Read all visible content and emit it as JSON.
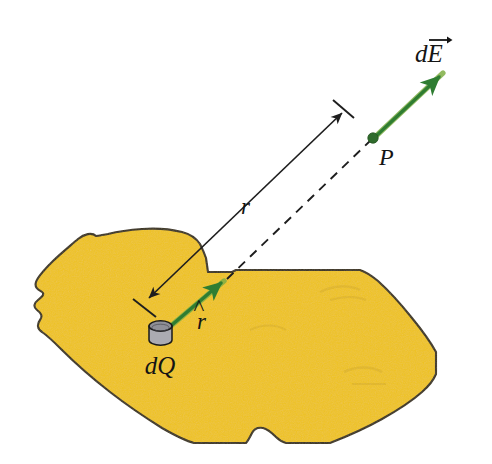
{
  "figure": {
    "type": "physics-vector-diagram"
  },
  "labels": {
    "field_vector": "dE",
    "field_vector_arrow": "→",
    "point": "P",
    "distance": "r",
    "unit_vector": "r",
    "unit_vector_hat": "^",
    "charge_element": "dQ"
  },
  "colors": {
    "surface_fill": "#EFC31C",
    "surface_fill_shade": "#E8BC16",
    "surface_outline": "#3A3119",
    "vector_green": "#2F7D32",
    "vector_green_light": "#6FA83F",
    "point_green": "#2F6B2C",
    "cylinder_top": "#8F8F97",
    "cylinder_body": "#ABABB2",
    "cylinder_outline": "#1A1A1A",
    "line_black": "#1E1E1E",
    "background": "#FFFFFF"
  },
  "geometry": {
    "point_P": {
      "x": 373,
      "y": 138
    },
    "charge_element": {
      "x": 160,
      "y": 332
    },
    "surface_hit": {
      "x": 228,
      "y": 278
    },
    "dE_tip": {
      "x": 445,
      "y": 70
    },
    "r_line_start": {
      "x": 146,
      "y": 301
    },
    "r_line_end": {
      "x": 345,
      "y": 110
    }
  },
  "elements": {
    "surface_name": "charged-surface",
    "dashed_line_name": "line-of-sight",
    "dimension_line_name": "distance-dimension-line"
  }
}
